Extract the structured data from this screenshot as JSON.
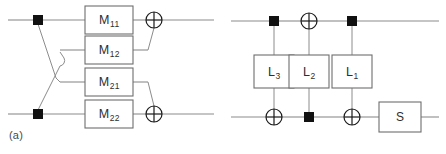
{
  "figure": {
    "width": 446,
    "height": 154,
    "background": "#ffffff",
    "wire_color": "#8c8c8c",
    "box_stroke": "#6e6e6e",
    "symbol_color": "#1a1a1a",
    "text_color": "#2e2e2e"
  },
  "panels": [
    {
      "id": "a",
      "caption": "(a)",
      "wire_count": 4,
      "gates": [
        {
          "name": "M11",
          "base": "M",
          "sub": "11",
          "wire": 1
        },
        {
          "name": "M12",
          "base": "M",
          "sub": "12",
          "wire": 2
        },
        {
          "name": "M21",
          "base": "M",
          "sub": "21",
          "wire": 3
        },
        {
          "name": "M22",
          "base": "M",
          "sub": "22",
          "wire": 4
        }
      ],
      "controls": [
        {
          "type": "square-control",
          "wire": 1
        },
        {
          "type": "square-control",
          "wire": 4
        }
      ],
      "targets": [
        {
          "type": "xor-target",
          "wire": 1
        },
        {
          "type": "xor-target",
          "wire": 4
        }
      ],
      "crossing": "wire-hop-crossover"
    },
    {
      "id": "b",
      "caption": "(b)",
      "wire_count": 2,
      "gates": [
        {
          "name": "L3",
          "base": "L",
          "sub": "3",
          "column": 1
        },
        {
          "name": "L2",
          "base": "L",
          "sub": "2",
          "column": 2
        },
        {
          "name": "L1",
          "base": "L",
          "sub": "1",
          "column": 3
        },
        {
          "name": "S",
          "base": "S",
          "sub": "",
          "column": 4
        }
      ],
      "top_wire_symbols": [
        {
          "type": "square-control",
          "column": 1
        },
        {
          "type": "xor-target",
          "column": 2
        },
        {
          "type": "square-control",
          "column": 3
        }
      ],
      "bottom_wire_symbols": [
        {
          "type": "xor-target",
          "column": 1
        },
        {
          "type": "square-control",
          "column": 2
        },
        {
          "type": "xor-target",
          "column": 3
        }
      ]
    }
  ]
}
